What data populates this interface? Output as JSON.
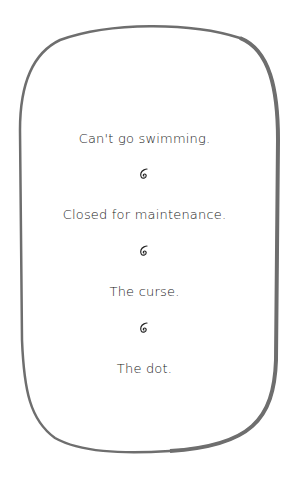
{
  "panel": {
    "border_color": "#6e6e6e",
    "lines": [
      {
        "text": "Can't go swimming."
      },
      {
        "text": "Closed for maintenance."
      },
      {
        "text": "The curse."
      },
      {
        "text": "The dot."
      }
    ],
    "separator_icon": "spiral-icon"
  }
}
